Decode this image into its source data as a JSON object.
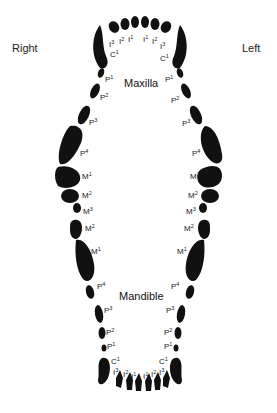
{
  "sides": {
    "right": "Right",
    "left": "Left"
  },
  "jaws": {
    "upper": "Maxilla",
    "lower": "Mandible"
  },
  "tooth_color": "#111111",
  "labels": {
    "upper_right": [
      {
        "id": "I3",
        "base": "I",
        "sup": "3"
      },
      {
        "id": "I2",
        "base": "I",
        "sup": "2"
      },
      {
        "id": "I1",
        "base": "I",
        "sup": "1"
      },
      {
        "id": "C1",
        "base": "C",
        "sup": "1"
      },
      {
        "id": "P1",
        "base": "P",
        "sup": "1"
      },
      {
        "id": "P2",
        "base": "P",
        "sup": "2"
      },
      {
        "id": "P3",
        "base": "P",
        "sup": "3"
      },
      {
        "id": "P4",
        "base": "P",
        "sup": "4"
      },
      {
        "id": "M1",
        "base": "M",
        "sup": "1"
      },
      {
        "id": "M2",
        "base": "M",
        "sup": "2"
      }
    ],
    "upper_left": [
      {
        "id": "I1",
        "base": "I",
        "sup": "1"
      },
      {
        "id": "I2",
        "base": "I",
        "sup": "2"
      },
      {
        "id": "I3",
        "base": "I",
        "sup": "3"
      },
      {
        "id": "C1",
        "base": "C",
        "sup": "1"
      },
      {
        "id": "P1",
        "base": "P",
        "sup": "1"
      },
      {
        "id": "P2",
        "base": "P",
        "sup": "2"
      },
      {
        "id": "P3",
        "base": "P",
        "sup": "3"
      },
      {
        "id": "P4",
        "base": "P",
        "sup": "4"
      },
      {
        "id": "M1",
        "base": "M",
        "sup": "1"
      },
      {
        "id": "M2",
        "base": "M",
        "sup": "2"
      }
    ],
    "lower_right": [
      {
        "id": "M3",
        "base": "M",
        "sup": "3"
      },
      {
        "id": "M2",
        "base": "M",
        "sup": "2"
      },
      {
        "id": "M1",
        "base": "M",
        "sup": "1"
      },
      {
        "id": "P4",
        "base": "P",
        "sup": "4"
      },
      {
        "id": "P3",
        "base": "P",
        "sup": "3"
      },
      {
        "id": "P2",
        "base": "P",
        "sup": "2"
      },
      {
        "id": "P1",
        "base": "P",
        "sup": "1"
      },
      {
        "id": "C1",
        "base": "C",
        "sup": "1"
      },
      {
        "id": "I3",
        "base": "I",
        "sup": "3"
      },
      {
        "id": "I2",
        "base": "I",
        "sup": "2"
      },
      {
        "id": "I1",
        "base": "I",
        "sup": "1"
      }
    ],
    "lower_left": [
      {
        "id": "M3",
        "base": "M",
        "sup": "3"
      },
      {
        "id": "M2",
        "base": "M",
        "sup": "2"
      },
      {
        "id": "M1",
        "base": "M",
        "sup": "1"
      },
      {
        "id": "P4",
        "base": "P",
        "sup": "4"
      },
      {
        "id": "P3",
        "base": "P",
        "sup": "3"
      },
      {
        "id": "P2",
        "base": "P",
        "sup": "2"
      },
      {
        "id": "P1",
        "base": "P",
        "sup": "1"
      },
      {
        "id": "C1",
        "base": "C",
        "sup": "1"
      },
      {
        "id": "I1",
        "base": "I",
        "sup": "1"
      },
      {
        "id": "I2",
        "base": "I",
        "sup": "2"
      },
      {
        "id": "I3",
        "base": "I",
        "sup": "3"
      }
    ]
  }
}
